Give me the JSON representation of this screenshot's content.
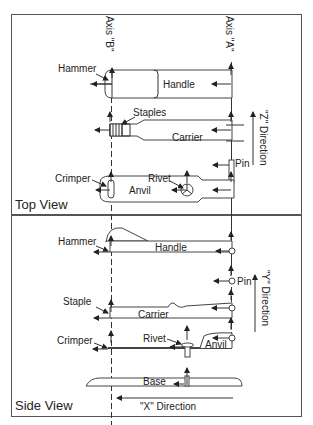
{
  "axes": {
    "axis_b": "Axis \"B\"",
    "axis_a": "Axis \"A\""
  },
  "top_view": {
    "title": "Top View",
    "labels": {
      "hammer": "Hammer",
      "handle": "Handle",
      "staples": "Staples",
      "carrier": "Carrier",
      "pin": "Pin",
      "crimper": "Crimper",
      "rivet": "Rivet",
      "anvil": "Anvil"
    },
    "direction": "\"Z\" Direction"
  },
  "side_view": {
    "title": "Side View",
    "labels": {
      "hammer": "Hammer",
      "handle": "Handle",
      "pin": "Pin",
      "staple": "Staple",
      "carrier": "Carrier",
      "crimper": "Crimper",
      "rivet": "Rivet",
      "anvil": "Anvil",
      "base": "Base"
    },
    "direction_y": "\"Y\" Direction",
    "direction_x": "\"X\" Direction"
  }
}
